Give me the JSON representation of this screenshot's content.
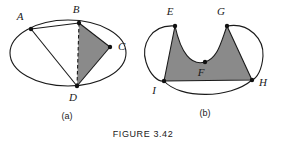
{
  "caption": {
    "text": "FIGURE 3.42"
  },
  "panels": [
    {
      "id": "panel-a",
      "sub_caption": "(a)",
      "description": "Ellipse with inscribed quadrilateral ABCD divided by dashed diagonal BD; triangle BCD is shaded gray",
      "shape": "ellipse",
      "ellipse": {
        "cx": 68,
        "cy": 53,
        "rx": 58,
        "ry": 33
      },
      "fill_color": "#8a8a8a",
      "stroke_color": "#1a1a1a",
      "points": [
        {
          "label": "A",
          "x": 31,
          "y": 29,
          "label_x": 20,
          "label_y": 20
        },
        {
          "label": "B",
          "x": 79,
          "y": 23,
          "label_x": 76,
          "label_y": 13
        },
        {
          "label": "C",
          "x": 110,
          "y": 47,
          "label_x": 118,
          "label_y": 50
        },
        {
          "label": "D",
          "x": 77,
          "y": 86,
          "label_x": 73,
          "label_y": 101
        }
      ],
      "solid_edges": [
        {
          "from": "A",
          "to": "B"
        },
        {
          "from": "A",
          "to": "D"
        },
        {
          "from": "B",
          "to": "C"
        },
        {
          "from": "C",
          "to": "D"
        }
      ],
      "dashed_edges": [
        {
          "from": "B",
          "to": "D"
        }
      ],
      "shaded_region": [
        "B",
        "C",
        "D"
      ]
    },
    {
      "id": "panel-b",
      "sub_caption": "(b)",
      "description": "Region bounded by curve E-F-G and straight edges G-H, H-I, I-E; shaded gray with white lune arcs outside",
      "shape": "curved-polygon",
      "fill_color": "#8a8a8a",
      "stroke_color": "#1a1a1a",
      "points": [
        {
          "label": "E",
          "x": 175,
          "y": 26,
          "label_x": 170,
          "label_y": 15
        },
        {
          "label": "G",
          "x": 227,
          "y": 26,
          "label_x": 221,
          "label_y": 15
        },
        {
          "label": "F",
          "x": 205,
          "y": 62,
          "label_x": 201,
          "label_y": 76
        },
        {
          "label": "H",
          "x": 252,
          "y": 80,
          "label_x": 259,
          "label_y": 86
        },
        {
          "label": "I",
          "x": 164,
          "y": 81,
          "label_x": 154,
          "label_y": 94
        }
      ],
      "straight_edges": [
        {
          "from": "G",
          "to": "H"
        },
        {
          "from": "H",
          "to": "I"
        },
        {
          "from": "I",
          "to": "E"
        }
      ],
      "curved_edges": [
        {
          "from": "E",
          "through": "F",
          "to": "G",
          "note": "dips down to F"
        },
        {
          "from": "E",
          "to": "I",
          "note": "outer arc bulging left"
        },
        {
          "from": "G",
          "to": "H",
          "note": "outer arc bulging right"
        },
        {
          "from": "I",
          "to": "H",
          "note": "outer arc bulging down"
        }
      ],
      "shaded_region": [
        "E",
        "F",
        "G",
        "H",
        "I"
      ]
    }
  ]
}
